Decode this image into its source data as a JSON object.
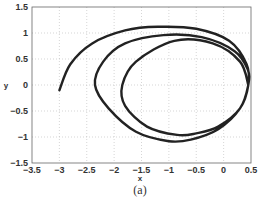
{
  "chart_data": {
    "type": "line",
    "title": "",
    "caption": "(a)",
    "xlabel": "x",
    "ylabel": "y",
    "xlim": [
      -3.5,
      0.5
    ],
    "ylim": [
      -1.5,
      1.5
    ],
    "xticks": [
      "-3.5",
      "-3",
      "-2.5",
      "-2",
      "-1.5",
      "-1",
      "-0.5",
      "0",
      "0.5"
    ],
    "yticks": [
      "1.5",
      "1",
      "0.5",
      "0",
      "-0.5",
      "-1",
      "-1.5"
    ],
    "grid": true,
    "legend": null,
    "series": [
      {
        "name": "phase trajectory (spiral converging to limit cycle)",
        "color": "#222222",
        "x": [
          -3.0,
          -2.8,
          -2.4,
          -1.8,
          -1.2,
          -0.5,
          0.1,
          0.42,
          0.45,
          0.3,
          -0.1,
          -0.6,
          -1.0,
          -1.6,
          -2.1,
          -2.35,
          -2.2,
          -1.8,
          -1.1,
          -0.4,
          0.2,
          0.44,
          0.45,
          0.3,
          -0.1,
          -0.5,
          -0.85,
          -1.4,
          -1.8,
          -1.85,
          -1.6,
          -0.9,
          -0.2,
          0.3,
          0.45
        ],
        "y": [
          -0.1,
          0.4,
          0.8,
          1.05,
          1.12,
          1.08,
          0.85,
          0.4,
          0.0,
          -0.45,
          -0.85,
          -1.05,
          -1.08,
          -0.9,
          -0.45,
          0.0,
          0.45,
          0.8,
          0.96,
          0.92,
          0.65,
          0.3,
          0.0,
          -0.45,
          -0.8,
          -0.93,
          -0.96,
          -0.8,
          -0.4,
          0.0,
          0.45,
          0.85,
          0.8,
          0.45,
          0.0
        ]
      }
    ]
  }
}
